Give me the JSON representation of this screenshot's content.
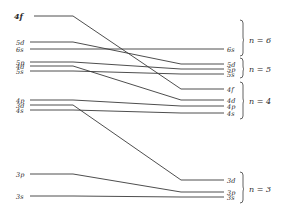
{
  "diagram": {
    "type": "energy-level correlation diagram",
    "left_levels": [
      {
        "label": "4f",
        "y": 16
      },
      {
        "label": "5d",
        "y": 42
      },
      {
        "label": "6s",
        "y": 49
      },
      {
        "label": "5p",
        "y": 62
      },
      {
        "label": "4d",
        "y": 66
      },
      {
        "label": "5s",
        "y": 71
      },
      {
        "label": "4p",
        "y": 100
      },
      {
        "label": "3d",
        "y": 105
      },
      {
        "label": "4s",
        "y": 110
      },
      {
        "label": "3p",
        "y": 174
      },
      {
        "label": "3s",
        "y": 196
      }
    ],
    "right_levels": [
      {
        "label": "6s",
        "y": 49
      },
      {
        "label": "5d",
        "y": 64
      },
      {
        "label": "5p",
        "y": 69
      },
      {
        "label": "5s",
        "y": 74
      },
      {
        "label": "4f",
        "y": 89
      },
      {
        "label": "4d",
        "y": 100
      },
      {
        "label": "4p",
        "y": 106
      },
      {
        "label": "4s",
        "y": 113
      },
      {
        "label": "3d",
        "y": 180
      },
      {
        "label": "3p",
        "y": 192
      },
      {
        "label": "3s",
        "y": 197
      }
    ],
    "shells": [
      {
        "label": "n = 6",
        "y_top": 20,
        "y_bottom": 56,
        "y_mid": 40
      },
      {
        "label": "n = 5",
        "y_top": 58,
        "y_bottom": 78,
        "y_mid": 69
      },
      {
        "label": "n = 4",
        "y_top": 82,
        "y_bottom": 119,
        "y_mid": 101
      },
      {
        "label": "n = 3",
        "y_top": 172,
        "y_bottom": 203,
        "y_mid": 189
      }
    ],
    "connections": [
      {
        "from": "4f",
        "to": "4f"
      },
      {
        "from": "5d",
        "to": "5d"
      },
      {
        "from": "6s",
        "to": "6s"
      },
      {
        "from": "5p",
        "to": "5p"
      },
      {
        "from": "4d",
        "to": "4d"
      },
      {
        "from": "5s",
        "to": "5s"
      },
      {
        "from": "4p",
        "to": "4p"
      },
      {
        "from": "3d",
        "to": "3d"
      },
      {
        "from": "4s",
        "to": "4s"
      },
      {
        "from": "3p",
        "to": "3p"
      },
      {
        "from": "3s",
        "to": "3s"
      }
    ],
    "colors": {
      "line": "#3a3a3a",
      "text": "#2b2b2b",
      "background": "#ffffff"
    }
  }
}
